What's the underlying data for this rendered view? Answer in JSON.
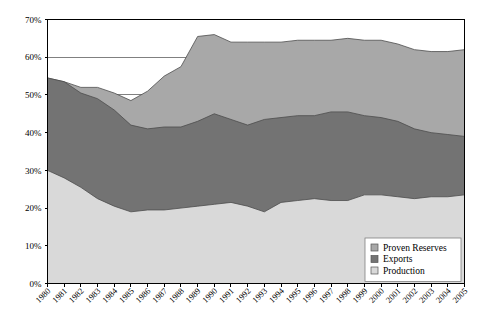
{
  "chart_data": {
    "type": "area",
    "stacked": true,
    "title": "",
    "xlabel": "",
    "ylabel": "",
    "ylim": [
      0,
      70
    ],
    "ytick_labels": [
      "0%",
      "10%",
      "20%",
      "30%",
      "40%",
      "50%",
      "60%",
      "70%"
    ],
    "ytick_values": [
      0,
      10,
      20,
      30,
      40,
      50,
      60,
      70
    ],
    "grid": true,
    "legend_position": "bottom-right",
    "categories": [
      "1980",
      "1981",
      "1982",
      "1983",
      "1984",
      "1985",
      "1986",
      "1987",
      "1988",
      "1989",
      "1990",
      "1991",
      "1992",
      "1993",
      "1994",
      "1995",
      "1996",
      "1997",
      "1998",
      "1999",
      "2000",
      "2001",
      "2002",
      "2003",
      "2004",
      "2005"
    ],
    "series": [
      {
        "name": "Production",
        "color": "#d9d9d9",
        "values": [
          30,
          28,
          25.5,
          22.5,
          20.5,
          19,
          19.5,
          19.5,
          20,
          20.5,
          21,
          21.5,
          20.5,
          19,
          21.5,
          22,
          22.5,
          22,
          22,
          23.5,
          23.5,
          23,
          22.5,
          23,
          23,
          23.5
        ]
      },
      {
        "name": "Exports",
        "color": "#737373",
        "values": [
          24.5,
          25.5,
          25,
          26.5,
          25.5,
          23,
          21.5,
          22,
          21.5,
          22.5,
          24,
          22,
          21.5,
          24.5,
          22.5,
          22.5,
          22,
          23.5,
          23.5,
          21,
          20.5,
          20,
          18.5,
          17,
          16.5,
          15.5
        ]
      },
      {
        "name": "Proven Reserves",
        "color": "#a8a8a8",
        "values": [
          0,
          0,
          1.5,
          3,
          4.5,
          6.5,
          10,
          13.5,
          16,
          22.5,
          21,
          20.5,
          22,
          20.5,
          20,
          20,
          20,
          19,
          19.5,
          20,
          20.5,
          20.5,
          21,
          21.5,
          22,
          23
        ]
      }
    ],
    "stack_totals": [
      54.5,
      53.5,
      52,
      52,
      50.5,
      48.5,
      51,
      55,
      57.5,
      65.5,
      66,
      64,
      64,
      64,
      64,
      64.5,
      64.5,
      64.5,
      65,
      64.5,
      64.5,
      63.5,
      62,
      61.5,
      61.5,
      62
    ],
    "band_upper_production": [
      30,
      28,
      25.5,
      22.5,
      20.5,
      19,
      19.5,
      19.5,
      20,
      20.5,
      21,
      21.5,
      20.5,
      19,
      21.5,
      22,
      22.5,
      22,
      22,
      23.5,
      23.5,
      23,
      22.5,
      23,
      23,
      23.5
    ],
    "band_upper_exports": [
      54.5,
      53.5,
      50.5,
      49,
      46,
      42,
      41,
      41.5,
      41.5,
      43,
      45,
      43.5,
      42,
      43.5,
      44,
      44.5,
      44.5,
      45.5,
      45.5,
      44.5,
      44,
      43,
      41,
      40,
      39.5,
      39
    ],
    "band_upper_reserves": [
      54.5,
      53.5,
      52,
      52,
      50.5,
      48.5,
      51,
      55,
      57.5,
      65.5,
      66,
      64,
      64,
      64,
      64,
      64.5,
      64.5,
      64.5,
      65,
      64.5,
      64.5,
      63.5,
      62,
      61.5,
      61.5,
      62
    ]
  },
  "legend": {
    "items": [
      {
        "label": "Proven Reserves",
        "color": "#a8a8a8"
      },
      {
        "label": "Exports",
        "color": "#737373"
      },
      {
        "label": "Production",
        "color": "#d9d9d9"
      }
    ]
  }
}
